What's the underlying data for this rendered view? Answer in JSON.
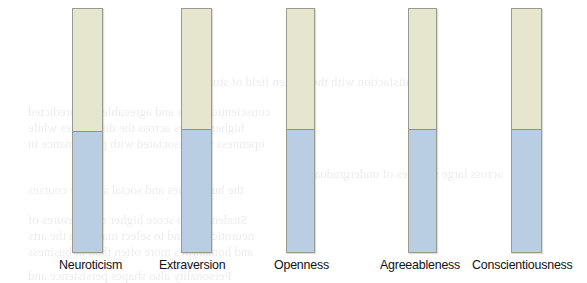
{
  "figure": {
    "higher_label": "Higher",
    "lower_label": "Lower",
    "colors": {
      "higher_fill": "#e6e6cf",
      "lower_fill": "#b9cde3",
      "bar_border": "#9a9a8e",
      "split_line": "#7f93ad",
      "text": "#16161a",
      "background": "#ffffff"
    }
  },
  "chart_data": {
    "type": "bar",
    "title": "",
    "xlabel": "",
    "ylabel": "",
    "grid": false,
    "legend": "none",
    "stacked": true,
    "categories": [
      "Neuroticism",
      "Extraversion",
      "Openness",
      "Agreeableness",
      "Conscientiousness"
    ],
    "series": [
      {
        "name": "Higher",
        "values": [
          50,
          51,
          52,
          52,
          52
        ]
      },
      {
        "name": "Lower",
        "values": [
          50,
          49,
          48,
          48,
          48
        ]
      }
    ],
    "annotations": [
      {
        "category": "Neuroticism",
        "higher": [
          "Arts,",
          "Humanities"
        ],
        "lower": [
          "Economics",
          "and",
          "Business"
        ]
      },
      {
        "category": "Extraversion",
        "higher": [
          "Economics,",
          "Law,",
          "Political Science,",
          "Medicine"
        ],
        "lower": [
          "Arts,",
          "Humanities,",
          "Sciences"
        ]
      },
      {
        "category": "Openness",
        "higher": [
          "Humanities,",
          "Arts,",
          "Psychology,",
          "Political Science"
        ],
        "lower": [
          "Economics,",
          "Engineering,",
          "Law,",
          "Sciences"
        ]
      },
      {
        "category": "Agreeableness",
        "higher": [
          "Medicine,",
          "Psychology,",
          "Sciences,",
          "Arts,",
          "Humanities"
        ],
        "lower": [
          "Law,",
          "Business,",
          "Economics"
        ]
      },
      {
        "category": "Conscientiousness",
        "higher": [
          "Sciences,",
          "Law,",
          "Economics,",
          "Engineering,",
          "Medicine,",
          "Psychology"
        ],
        "lower": [
          "Arts,",
          "Humanities"
        ]
      }
    ]
  },
  "columns": [
    {
      "caption": "Neuroticism",
      "higher_title": "Higher",
      "higher_lines": [
        "Arts,",
        "Humanities"
      ],
      "lower_title": "Lower",
      "lower_lines": [
        "Economics",
        "and",
        "Business"
      ]
    },
    {
      "caption": "Extraversion",
      "higher_title": "Higher",
      "higher_lines": [
        "Economics,",
        "Law,",
        "Political Science,",
        "Medicine"
      ],
      "lower_title": "Lower",
      "lower_lines": [
        "Arts,",
        "Humanities,",
        "Sciences"
      ]
    },
    {
      "caption": "Openness",
      "higher_title": "Higher",
      "higher_lines": [
        "Humanities,",
        "Arts,",
        "Psychology,",
        "Political Science"
      ],
      "lower_title": "Lower",
      "lower_lines": [
        "Economics,",
        "Engineering,",
        "Law,",
        "Sciences"
      ]
    },
    {
      "caption": "Agreeableness",
      "higher_title": "Higher",
      "higher_lines": [
        "Medicine,",
        "Psychology,",
        "Sciences,",
        "Arts,",
        "Humanities"
      ],
      "lower_title": "Lower",
      "lower_lines": [
        "Law,",
        "Business,",
        "Economics"
      ]
    },
    {
      "caption": "Conscientiousness",
      "higher_title": "Higher",
      "higher_lines": [
        "Sciences,",
        "Law,",
        "Economics,",
        "Engineering,",
        "Medicine,",
        "Psychology"
      ],
      "lower_title": "Lower",
      "lower_lines": [
        "Arts,",
        "Humanities"
      ]
    }
  ]
}
